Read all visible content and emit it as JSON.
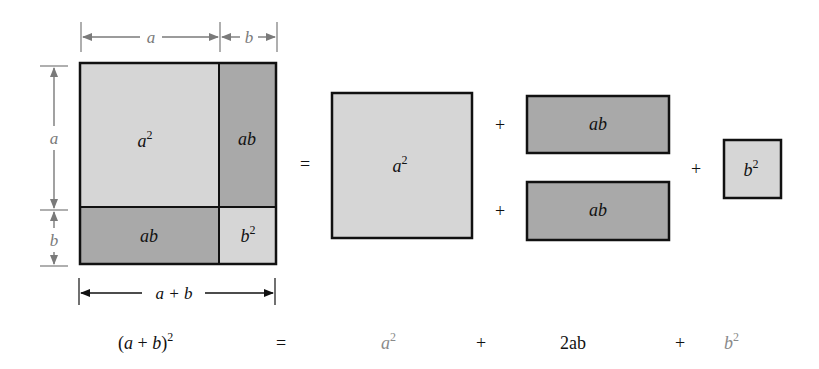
{
  "colors": {
    "light_fill": "#d6d6d6",
    "dark_fill": "#a9a9a9",
    "outline": "#111111",
    "dimension": "#7a7a7a",
    "equation_dark": "#111111",
    "equation_light": "#8a8a8a"
  },
  "left_figure": {
    "dim_top": {
      "a": "a",
      "b": "b"
    },
    "dim_side": {
      "a": "a",
      "b": "b"
    },
    "dim_bottom": "a + b",
    "regions": {
      "top_left": "a",
      "top_left_exp": "2",
      "top_right": "ab",
      "bottom_left": "ab",
      "bottom_right": "b",
      "bottom_right_exp": "2"
    }
  },
  "right_figure": {
    "equals": "=",
    "square_a": {
      "base": "a",
      "exp": "2"
    },
    "plus_1": "+",
    "rect_top": "ab",
    "plus_2": "+",
    "rect_bottom": "ab",
    "plus_3": "+",
    "square_b": {
      "base": "b",
      "exp": "2"
    }
  },
  "equation": {
    "lhs_open": "(",
    "lhs_a": "a",
    "lhs_plus": " + ",
    "lhs_b": "b",
    "lhs_close": ")",
    "lhs_exp": "2",
    "equals": "=",
    "term1_base": "a",
    "term1_exp": "2",
    "plus1": "+",
    "term2": "2ab",
    "plus2": "+",
    "term3_base": "b",
    "term3_exp": "2"
  }
}
